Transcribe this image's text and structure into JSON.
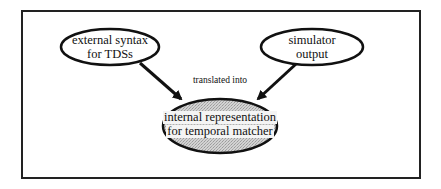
{
  "diagram": {
    "type": "flow",
    "nodes": [
      {
        "id": "external",
        "lines": [
          "external syntax",
          "for TDSs"
        ],
        "style": "plain"
      },
      {
        "id": "simulator",
        "lines": [
          "simulator",
          "output"
        ],
        "style": "plain"
      },
      {
        "id": "internal",
        "lines": [
          "internal representation",
          "for temporal matcher"
        ],
        "style": "shaded"
      }
    ],
    "edges": [
      {
        "from": "external",
        "to": "internal"
      },
      {
        "from": "simulator",
        "to": "internal"
      }
    ],
    "edge_label": "translated into",
    "colors": {
      "stroke": "#111111",
      "frame": "#222222",
      "shade": "#c8c8c8",
      "text_box": "#f4f4f4"
    }
  }
}
